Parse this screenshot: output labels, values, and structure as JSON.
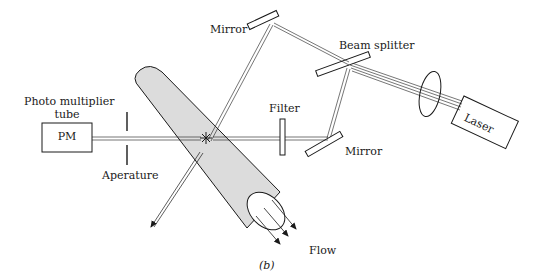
{
  "diagram": {
    "caption": "(b)",
    "labels": {
      "mirror_top": "Mirror",
      "beam_splitter": "Beam splitter",
      "laser": "Laser",
      "filter": "Filter",
      "mirror_bottom": "Mirror",
      "pm_title_line1": "Photo multiplier",
      "pm_title_line2": "tube",
      "pm_box": "PM",
      "aperture": "Aperature",
      "flow": "Flow"
    },
    "colors": {
      "ink": "#1a1a1a",
      "tube_fill": "#dcdcdc",
      "background": "#ffffff"
    }
  }
}
